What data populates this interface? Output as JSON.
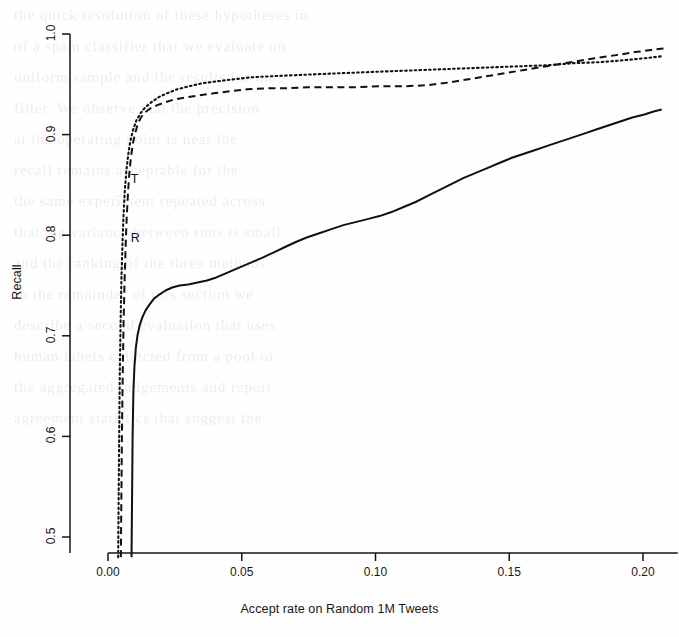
{
  "figure": {
    "kind": "scanned-journal-figure",
    "background_note": "faint show-through text from reverse page"
  },
  "chart_data": {
    "type": "line",
    "title": "",
    "subtitle": "",
    "xlabel": "Accept rate on Random 1M Tweets",
    "ylabel": "Recall",
    "xlim": [
      -0.006,
      0.213
    ],
    "ylim": [
      0.478,
      1.012
    ],
    "xticks": [
      0.0,
      0.05,
      0.1,
      0.15,
      0.2
    ],
    "xtick_labels": [
      "0.00",
      "0.05",
      "0.10",
      "0.15",
      "0.20"
    ],
    "yticks": [
      0.5,
      0.6,
      0.7,
      0.8,
      0.9,
      1.0
    ],
    "ytick_labels": [
      "0.5",
      "0.6",
      "0.7",
      "0.8",
      "0.9",
      "1.0"
    ],
    "grid": false,
    "legend": "inline-curve-labels",
    "annotations": [
      {
        "text": "T",
        "x": 0.0085,
        "y": 0.855,
        "series": "T"
      },
      {
        "text": "R",
        "x": 0.0085,
        "y": 0.796,
        "series": "R"
      }
    ],
    "series": [
      {
        "name": "solid",
        "label": "",
        "style": "solid",
        "color": "#111111",
        "points": [
          [
            0.0088,
            0.48
          ],
          [
            0.009,
            0.54
          ],
          [
            0.0092,
            0.6
          ],
          [
            0.0095,
            0.645
          ],
          [
            0.0099,
            0.67
          ],
          [
            0.0104,
            0.688
          ],
          [
            0.011,
            0.7
          ],
          [
            0.0118,
            0.71
          ],
          [
            0.0128,
            0.718
          ],
          [
            0.014,
            0.725
          ],
          [
            0.0155,
            0.731
          ],
          [
            0.0172,
            0.737
          ],
          [
            0.0192,
            0.741
          ],
          [
            0.0215,
            0.745
          ],
          [
            0.024,
            0.748
          ],
          [
            0.0268,
            0.75
          ],
          [
            0.03,
            0.751
          ],
          [
            0.0335,
            0.753
          ],
          [
            0.037,
            0.755
          ],
          [
            0.0405,
            0.758
          ],
          [
            0.044,
            0.762
          ],
          [
            0.0475,
            0.766
          ],
          [
            0.051,
            0.77
          ],
          [
            0.0545,
            0.774
          ],
          [
            0.058,
            0.778
          ],
          [
            0.062,
            0.783
          ],
          [
            0.066,
            0.788
          ],
          [
            0.07,
            0.793
          ],
          [
            0.0745,
            0.798
          ],
          [
            0.079,
            0.802
          ],
          [
            0.0835,
            0.806
          ],
          [
            0.088,
            0.81
          ],
          [
            0.0925,
            0.813
          ],
          [
            0.097,
            0.816
          ],
          [
            0.1015,
            0.819
          ],
          [
            0.106,
            0.823
          ],
          [
            0.1105,
            0.828
          ],
          [
            0.115,
            0.833
          ],
          [
            0.1195,
            0.839
          ],
          [
            0.124,
            0.845
          ],
          [
            0.1285,
            0.851
          ],
          [
            0.133,
            0.857
          ],
          [
            0.1375,
            0.862
          ],
          [
            0.142,
            0.867
          ],
          [
            0.1465,
            0.872
          ],
          [
            0.151,
            0.877
          ],
          [
            0.1555,
            0.881
          ],
          [
            0.16,
            0.885
          ],
          [
            0.1645,
            0.889
          ],
          [
            0.169,
            0.893
          ],
          [
            0.1735,
            0.897
          ],
          [
            0.178,
            0.901
          ],
          [
            0.1825,
            0.905
          ],
          [
            0.187,
            0.909
          ],
          [
            0.1915,
            0.913
          ],
          [
            0.196,
            0.917
          ],
          [
            0.2005,
            0.92
          ],
          [
            0.204,
            0.923
          ],
          [
            0.207,
            0.925
          ]
        ]
      },
      {
        "name": "T",
        "label": "T",
        "style": "dashed",
        "color": "#111111",
        "points": [
          [
            0.0048,
            0.48
          ],
          [
            0.005,
            0.54
          ],
          [
            0.0052,
            0.6
          ],
          [
            0.0055,
            0.66
          ],
          [
            0.0058,
            0.71
          ],
          [
            0.0062,
            0.755
          ],
          [
            0.0066,
            0.79
          ],
          [
            0.007,
            0.818
          ],
          [
            0.0075,
            0.843
          ],
          [
            0.008,
            0.862
          ],
          [
            0.0086,
            0.878
          ],
          [
            0.0093,
            0.891
          ],
          [
            0.0101,
            0.901
          ],
          [
            0.0111,
            0.91
          ],
          [
            0.0123,
            0.917
          ],
          [
            0.0138,
            0.922
          ],
          [
            0.0158,
            0.926
          ],
          [
            0.0182,
            0.929
          ],
          [
            0.0212,
            0.932
          ],
          [
            0.0248,
            0.935
          ],
          [
            0.029,
            0.937
          ],
          [
            0.034,
            0.939
          ],
          [
            0.0395,
            0.941
          ],
          [
            0.0455,
            0.943
          ],
          [
            0.052,
            0.945
          ],
          [
            0.059,
            0.946
          ],
          [
            0.0665,
            0.946
          ],
          [
            0.0745,
            0.947
          ],
          [
            0.083,
            0.947
          ],
          [
            0.092,
            0.947
          ],
          [
            0.101,
            0.948
          ],
          [
            0.11,
            0.948
          ],
          [
            0.119,
            0.949
          ],
          [
            0.128,
            0.952
          ],
          [
            0.137,
            0.956
          ],
          [
            0.146,
            0.96
          ],
          [
            0.155,
            0.964
          ],
          [
            0.164,
            0.968
          ],
          [
            0.173,
            0.972
          ],
          [
            0.182,
            0.976
          ],
          [
            0.19,
            0.979
          ],
          [
            0.197,
            0.982
          ],
          [
            0.203,
            0.984
          ],
          [
            0.2085,
            0.986
          ]
        ]
      },
      {
        "name": "R",
        "label": "R",
        "style": "dotted",
        "color": "#111111",
        "points": [
          [
            0.0038,
            0.48
          ],
          [
            0.004,
            0.545
          ],
          [
            0.0042,
            0.605
          ],
          [
            0.0044,
            0.662
          ],
          [
            0.0047,
            0.712
          ],
          [
            0.005,
            0.755
          ],
          [
            0.0054,
            0.791
          ],
          [
            0.0058,
            0.82
          ],
          [
            0.0063,
            0.845
          ],
          [
            0.0069,
            0.865
          ],
          [
            0.0076,
            0.881
          ],
          [
            0.0084,
            0.894
          ],
          [
            0.0094,
            0.905
          ],
          [
            0.0106,
            0.914
          ],
          [
            0.0121,
            0.921
          ],
          [
            0.0139,
            0.927
          ],
          [
            0.0161,
            0.932
          ],
          [
            0.0188,
            0.937
          ],
          [
            0.022,
            0.941
          ],
          [
            0.0258,
            0.945
          ],
          [
            0.0302,
            0.948
          ],
          [
            0.0352,
            0.951
          ],
          [
            0.0408,
            0.953
          ],
          [
            0.047,
            0.955
          ],
          [
            0.0538,
            0.957
          ],
          [
            0.0612,
            0.958
          ],
          [
            0.0692,
            0.959
          ],
          [
            0.0778,
            0.96
          ],
          [
            0.0868,
            0.961
          ],
          [
            0.0962,
            0.962
          ],
          [
            0.1058,
            0.963
          ],
          [
            0.1155,
            0.964
          ],
          [
            0.1252,
            0.965
          ],
          [
            0.135,
            0.966
          ],
          [
            0.1448,
            0.967
          ],
          [
            0.1546,
            0.968
          ],
          [
            0.1644,
            0.969
          ],
          [
            0.1742,
            0.971
          ],
          [
            0.184,
            0.972
          ],
          [
            0.193,
            0.974
          ],
          [
            0.201,
            0.976
          ],
          [
            0.2075,
            0.978
          ]
        ]
      }
    ]
  },
  "bleed_lines": [
    "the quick resolution of these hypotheses in",
    "",
    "of a spam classifier that we evaluate on",
    "",
    "uniform sample and the results for the",
    "filter. We observe that the precision",
    "at the operating point is near the",
    "recall remains acceptable for the",
    "",
    "the same experiment repeated across",
    "that the variance between runs is small",
    "and the ranking of the three methods",
    "",
    "In the remainder of this section we",
    "describe a second evaluation that uses",
    "human labels collected from a pool of",
    "",
    "the aggregated judgements and report",
    "agreement statistics that suggest the"
  ]
}
